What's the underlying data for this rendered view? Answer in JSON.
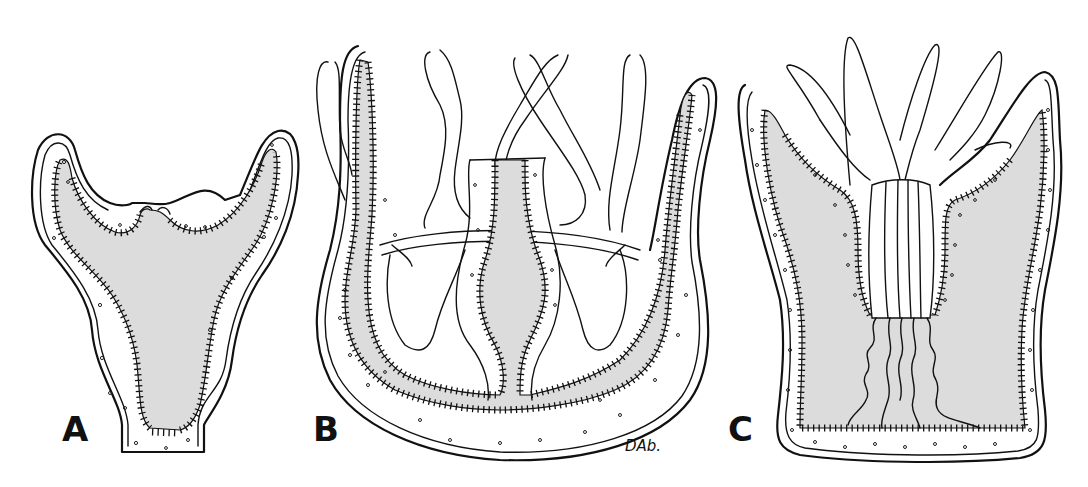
{
  "figure": {
    "panels": [
      {
        "id": "A",
        "label": "A",
        "subject": "polyp-section"
      },
      {
        "id": "B",
        "label": "B",
        "subject": "medusa-section"
      },
      {
        "id": "C",
        "label": "C",
        "subject": "anthozoan-polyp-section"
      }
    ],
    "signature": "DAb.",
    "colors": {
      "background": "#ffffff",
      "line": "#111111",
      "gastrovascular_cavity": "#dcdcdc",
      "mesoglea": "#ffffff"
    }
  }
}
